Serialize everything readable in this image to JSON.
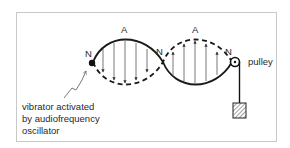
{
  "diagram": {
    "node_labels": [
      "N",
      "N",
      "N"
    ],
    "antinode_labels": [
      "A",
      "A"
    ],
    "pulley_label": "pulley",
    "vibrator_caption": {
      "line1": "vibrator activated",
      "line2": "by audiofrequency",
      "line3": "oscillator"
    },
    "colors": {
      "line": "#1a1a1a",
      "arrow": "#555555",
      "frame": "#c8c8c8",
      "text": "#2a2a2a"
    }
  }
}
